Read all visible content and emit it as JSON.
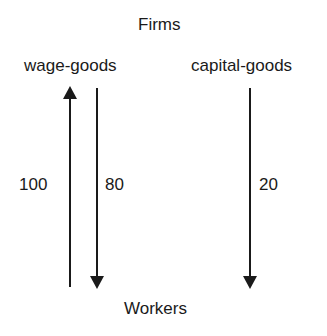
{
  "diagram": {
    "top_node": "Firms",
    "bottom_node": "Workers",
    "sectors": [
      {
        "label": "wage-goods"
      },
      {
        "label": "capital-goods"
      }
    ],
    "flows": [
      {
        "label": "100",
        "direction": "up",
        "from": "Workers",
        "to": "wage-goods"
      },
      {
        "label": "80",
        "direction": "down",
        "from": "wage-goods",
        "to": "Workers"
      },
      {
        "label": "20",
        "direction": "down",
        "from": "capital-goods",
        "to": "Workers"
      }
    ]
  }
}
